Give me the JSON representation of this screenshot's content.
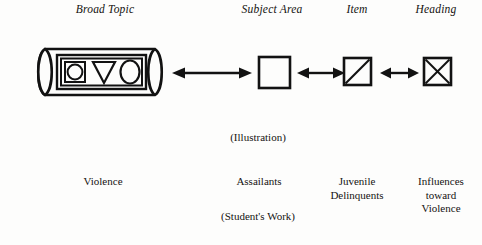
{
  "figure": {
    "type": "process-flow-diagram",
    "ink_color": "#121212",
    "background_color": "#fdfdfc",
    "headers": [
      {
        "id": "broad-topic",
        "label": "Broad Topic"
      },
      {
        "id": "subject-area",
        "label": "Subject Area"
      },
      {
        "id": "item",
        "label": "Item"
      },
      {
        "id": "heading",
        "label": "Heading"
      }
    ],
    "nodes": [
      {
        "id": "broad-topic",
        "glyph": "cylinder-with-shapes",
        "glyph_description": "horizontal cylinder containing a double-outlined rectangle holding a square-with-circle, a downward triangle and an oval"
      },
      {
        "id": "subject-area",
        "glyph": "empty-square",
        "glyph_description": "plain open square"
      },
      {
        "id": "item",
        "glyph": "square-with-diagonal",
        "glyph_description": "square crossed by one diagonal from bottom-left to top-right"
      },
      {
        "id": "heading",
        "glyph": "square-with-x",
        "glyph_description": "square crossed by both diagonals forming an X"
      }
    ],
    "connectors": [
      {
        "id": "broad-to-subject",
        "style": "double-headed-arrow",
        "from": "broad-topic",
        "to": "subject-area"
      },
      {
        "id": "subject-to-item",
        "style": "double-headed-arrow",
        "from": "subject-area",
        "to": "item"
      },
      {
        "id": "item-to-heading",
        "style": "double-headed-arrow",
        "from": "item",
        "to": "heading"
      }
    ],
    "captions": {
      "illustration": "(Illustration)",
      "students_work": "(Student's Work)"
    },
    "examples": [
      {
        "id": "violence",
        "text": "Violence"
      },
      {
        "id": "assailants",
        "text": "Assailants"
      },
      {
        "id": "juvenile",
        "text": "Juvenile\nDelinquents"
      },
      {
        "id": "influences",
        "text": "Influences\ntoward\nViolence"
      }
    ]
  }
}
